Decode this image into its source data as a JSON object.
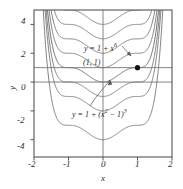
{
  "figure": {
    "background": "#fefefe",
    "frame_color": "#555555",
    "curve_color": "#6b6b6b",
    "axis_color": "#777777",
    "marker_color": "#111111",
    "text_color": "#2b2b2b"
  },
  "axes": {
    "x_label": "x",
    "y_label": "y",
    "x_ticks": [
      "-2",
      "-1",
      "0",
      "1",
      "2"
    ],
    "y_ticks": [
      "4",
      "2",
      "0",
      "-2",
      "-4"
    ],
    "xlim": [
      -2,
      2
    ],
    "ylim": [
      -5.2,
      5.0
    ],
    "grid": false
  },
  "annotations": {
    "upper_equation": "y = 1 + x",
    "upper_equation_exponent": "6",
    "lower_equation_prefix": "y = 1 + (x",
    "lower_equation_sq": "2",
    "lower_equation_mid": " − 1)",
    "lower_equation_cube": "3",
    "point_label": "(1, 1)",
    "point_x": 1,
    "point_y": 1
  },
  "chart_data": {
    "type": "line",
    "title": "",
    "xlabel": "x",
    "ylabel": "y",
    "xlim": [
      -2,
      2
    ],
    "ylim": [
      -5.2,
      5.0
    ],
    "grid": false,
    "x_ticks": [
      -2,
      -1,
      0,
      1,
      2
    ],
    "y_ticks": [
      -4,
      -2,
      0,
      2,
      4
    ],
    "family": "y = C + (x^2 - 1)^3",
    "series": [
      {
        "name": "C = 5",
        "C": 5,
        "highlight": false
      },
      {
        "name": "C = 4",
        "C": 4,
        "highlight": false
      },
      {
        "name": "C = 3",
        "C": 3,
        "highlight": false
      },
      {
        "name": "C = 2",
        "C": 2,
        "highlight": false
      },
      {
        "name": "C = 1",
        "C": 1,
        "highlight": true
      },
      {
        "name": "C = 0",
        "C": 0,
        "highlight": false
      },
      {
        "name": "C = -1",
        "C": -1,
        "highlight": false
      },
      {
        "name": "C = -3",
        "C": -3,
        "highlight": false
      }
    ],
    "reference_lines": [
      {
        "name": "y = 1",
        "y": 1
      },
      {
        "name": "y = 0",
        "y": 0
      }
    ],
    "marked_points": [
      {
        "x": 1,
        "y": 1,
        "label": "(1, 1)"
      }
    ],
    "annotations": [
      {
        "text": "y = 1 + x^6",
        "x": 0.45,
        "y": 2.55
      },
      {
        "text": "y = 1 + (x^2 - 1)^3",
        "x": 0.15,
        "y": -2.3
      }
    ]
  }
}
